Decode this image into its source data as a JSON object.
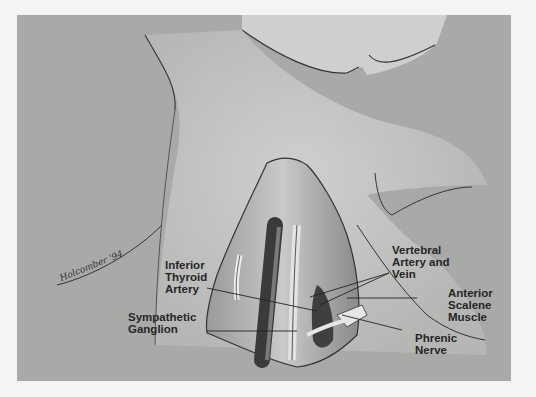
{
  "figure": {
    "type": "anatomical-illustration",
    "background_color": "#a9a9a8",
    "page_color": "#f4f4f3"
  },
  "labels": {
    "inferior_thyroid_artery": "Inferior\nThyroid\nArtery",
    "sympathetic_ganglion": "Sympathetic\nGanglion",
    "vertebral_artery_vein": "Vertebral\nArtery and\nVein",
    "anterior_scalene_muscle": "Anterior\nScalene\nMuscle",
    "phrenic_nerve": "Phrenic\nNerve"
  },
  "signature": "Holcomber '94"
}
